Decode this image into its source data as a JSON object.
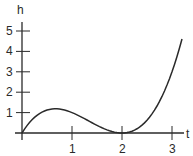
{
  "chart_data": {
    "type": "line",
    "title": "",
    "xlabel": "t",
    "ylabel": "h",
    "x_ticks": [
      "1",
      "2",
      "3"
    ],
    "y_ticks": [
      "1",
      "2",
      "3",
      "4",
      "5"
    ],
    "xlim": [
      0,
      3.2
    ],
    "ylim": [
      0,
      5
    ],
    "grid": false,
    "legend": null,
    "series": [
      {
        "name": "h(t)",
        "formula": "h = t(t-2)^2",
        "x": [
          0,
          0.25,
          0.5,
          0.667,
          1.0,
          1.25,
          1.5,
          1.75,
          2.0,
          2.25,
          2.5,
          2.75,
          3.0,
          3.2
        ],
        "values": [
          0,
          0.77,
          1.13,
          1.19,
          1.0,
          0.7,
          0.38,
          0.11,
          0,
          0.14,
          0.63,
          1.55,
          3.0,
          4.61
        ]
      }
    ],
    "annotations": [
      "local maximum near t≈0.67, h≈1.2",
      "minimum touching axis at t=2"
    ]
  },
  "colors": {
    "axis": "#2a2a2a",
    "curve": "#2a2a2a",
    "background": "#ffffff"
  }
}
